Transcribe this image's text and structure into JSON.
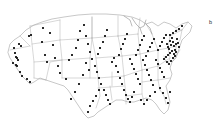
{
  "figure": {
    "panel_label": "b",
    "marker_color": "#141414",
    "boundary_color": "#9a9a9a",
    "background_color": "#ffffff"
  },
  "chart_data": {
    "type": "scatter",
    "title": "",
    "subtitle": "",
    "xlabel": "",
    "ylabel": "",
    "annotations": [
      "b"
    ],
    "legend": [],
    "grid": false,
    "basemap": "United States state boundaries (contiguous 48)",
    "projection": "albers-like",
    "xlim": [
      0,
      213
    ],
    "ylim": [
      0,
      127
    ],
    "marker": {
      "shape": "square",
      "size": 1.9,
      "color": "#141414"
    },
    "point_count": 128,
    "density_note": "Highest concentration along the Northeast corridor (New York / New Jersey / Pennsylvania / New England); sparse across the Mountain West and Great Plains.",
    "points": [
      [
        14,
        48
      ],
      [
        15,
        53
      ],
      [
        16,
        57
      ],
      [
        17,
        58
      ],
      [
        18,
        60
      ],
      [
        13,
        63
      ],
      [
        16,
        65
      ],
      [
        17,
        66
      ],
      [
        20,
        72
      ],
      [
        22,
        76
      ],
      [
        27,
        79
      ],
      [
        30,
        82
      ],
      [
        21,
        46
      ],
      [
        19,
        44
      ],
      [
        29,
        36
      ],
      [
        31,
        35
      ],
      [
        43,
        28
      ],
      [
        42,
        42
      ],
      [
        45,
        55
      ],
      [
        47,
        62
      ],
      [
        55,
        58
      ],
      [
        58,
        66
      ],
      [
        60,
        73
      ],
      [
        66,
        79
      ],
      [
        50,
        33
      ],
      [
        53,
        45
      ],
      [
        69,
        60
      ],
      [
        72,
        55
      ],
      [
        76,
        48
      ],
      [
        78,
        40
      ],
      [
        80,
        31
      ],
      [
        84,
        25
      ],
      [
        86,
        36
      ],
      [
        88,
        44
      ],
      [
        90,
        52
      ],
      [
        92,
        59
      ],
      [
        95,
        66
      ],
      [
        97,
        72
      ],
      [
        99,
        78
      ],
      [
        101,
        84
      ],
      [
        104,
        90
      ],
      [
        106,
        95
      ],
      [
        108,
        100
      ],
      [
        110,
        104
      ],
      [
        86,
        63
      ],
      [
        89,
        70
      ],
      [
        83,
        75
      ],
      [
        79,
        84
      ],
      [
        75,
        92
      ],
      [
        71,
        99
      ],
      [
        98,
        54
      ],
      [
        100,
        48
      ],
      [
        103,
        42
      ],
      [
        105,
        36
      ],
      [
        107,
        30
      ],
      [
        112,
        62
      ],
      [
        114,
        58
      ],
      [
        116,
        66
      ],
      [
        118,
        72
      ],
      [
        120,
        78
      ],
      [
        122,
        84
      ],
      [
        124,
        90
      ],
      [
        126,
        95
      ],
      [
        128,
        99
      ],
      [
        130,
        102
      ],
      [
        132,
        97
      ],
      [
        134,
        92
      ],
      [
        119,
        55
      ],
      [
        121,
        49
      ],
      [
        123,
        44
      ],
      [
        125,
        39
      ],
      [
        127,
        34
      ],
      [
        130,
        59
      ],
      [
        132,
        64
      ],
      [
        134,
        69
      ],
      [
        136,
        74
      ],
      [
        138,
        79
      ],
      [
        140,
        84
      ],
      [
        136,
        55
      ],
      [
        138,
        50
      ],
      [
        140,
        45
      ],
      [
        142,
        40
      ],
      [
        144,
        36
      ],
      [
        143,
        60
      ],
      [
        145,
        65
      ],
      [
        147,
        70
      ],
      [
        149,
        75
      ],
      [
        151,
        80
      ],
      [
        153,
        85
      ],
      [
        146,
        56
      ],
      [
        148,
        51
      ],
      [
        150,
        47
      ],
      [
        152,
        43
      ],
      [
        154,
        39
      ],
      [
        156,
        60
      ],
      [
        158,
        64
      ],
      [
        160,
        68
      ],
      [
        162,
        72
      ],
      [
        164,
        77
      ],
      [
        158,
        50
      ],
      [
        160,
        46
      ],
      [
        162,
        42
      ],
      [
        164,
        38
      ],
      [
        166,
        35
      ],
      [
        167,
        44
      ],
      [
        168,
        47
      ],
      [
        169,
        49
      ],
      [
        170,
        41
      ],
      [
        171,
        45
      ],
      [
        172,
        38
      ],
      [
        173,
        42
      ],
      [
        174,
        46
      ],
      [
        175,
        50
      ],
      [
        176,
        44
      ],
      [
        177,
        39
      ],
      [
        178,
        43
      ],
      [
        179,
        47
      ],
      [
        176,
        52
      ],
      [
        174,
        54
      ],
      [
        172,
        51
      ],
      [
        170,
        53
      ],
      [
        168,
        55
      ],
      [
        166,
        57
      ],
      [
        164,
        59
      ],
      [
        170,
        35
      ],
      [
        173,
        33
      ],
      [
        176,
        31
      ],
      [
        179,
        29
      ],
      [
        182,
        26
      ],
      [
        167,
        62
      ],
      [
        169,
        64
      ],
      [
        171,
        61
      ],
      [
        173,
        58
      ],
      [
        175,
        56
      ],
      [
        160,
        88
      ],
      [
        163,
        93
      ],
      [
        166,
        98
      ],
      [
        168,
        103
      ],
      [
        170,
        92
      ],
      [
        155,
        92
      ],
      [
        150,
        96
      ],
      [
        147,
        100
      ],
      [
        144,
        104
      ],
      [
        141,
        100
      ],
      [
        99,
        90
      ],
      [
        96,
        96
      ],
      [
        93,
        101
      ],
      [
        90,
        106
      ],
      [
        88,
        112
      ]
    ]
  }
}
